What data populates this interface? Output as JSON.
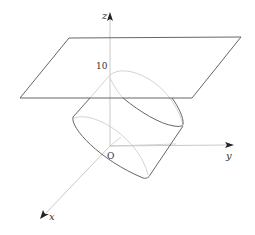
{
  "diagram": {
    "type": "3d-geometry",
    "axes": {
      "x_label": "x",
      "y_label": "y",
      "z_label": "z",
      "origin_label": "O"
    },
    "annotations": {
      "z_height_label": "10"
    },
    "colors": {
      "solid_line": "#555555",
      "hidden_line": "#c8c8c8",
      "axis_line": "#bbbbbb",
      "arrow": "#222222"
    }
  }
}
